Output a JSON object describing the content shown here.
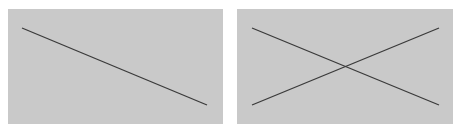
{
  "colors": {
    "background": "#ffffff",
    "panel": "#c9c9c9",
    "line": "#3a3a3a"
  },
  "panels": [
    {
      "name": "single-diagonal-panel",
      "lines": [
        {
          "x1": 14,
          "y1": 19,
          "x2": 199,
          "y2": 96
        }
      ]
    },
    {
      "name": "crossed-diagonals-panel",
      "lines": [
        {
          "x1": 15,
          "y1": 19,
          "x2": 202,
          "y2": 96
        },
        {
          "x1": 15,
          "y1": 96,
          "x2": 202,
          "y2": 19
        }
      ]
    }
  ]
}
